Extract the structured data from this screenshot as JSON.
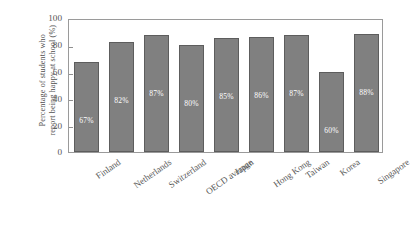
{
  "chart_data": {
    "type": "bar",
    "title": "",
    "xlabel": "",
    "ylabel": "Percentage of students who report being happy at school (%)",
    "ylabel_lines": [
      "Percentage of students who",
      "report being happy at school (%)"
    ],
    "categories": [
      "Finland",
      "Netherlands",
      "Switzerland",
      "OECD average",
      "Japan",
      "Hong Kong",
      "Taiwan",
      "Korea",
      "Singapore"
    ],
    "values": [
      67,
      82,
      87,
      80,
      85,
      86,
      87,
      60,
      88
    ],
    "data_labels": [
      "67%",
      "82%",
      "87%",
      "80%",
      "85%",
      "86%",
      "87%",
      "60%",
      "88%"
    ],
    "ylim": [
      0,
      100
    ],
    "yticks": [
      0,
      20,
      40,
      60,
      80,
      100
    ],
    "ytick_labels": [
      "0",
      "20",
      "40",
      "60",
      "80",
      "100"
    ],
    "grid": false,
    "legend": null,
    "bar_color": "#808080",
    "bar_edge_color": "#5d5d5d",
    "axis_color": "#9a9a9a",
    "label_color": "#ffffff",
    "background": "#ffffff"
  }
}
